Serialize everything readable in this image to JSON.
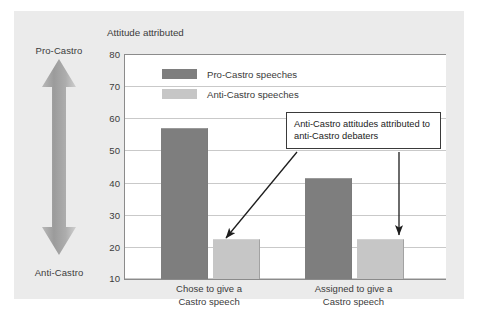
{
  "figure": {
    "title": "Attitude attributed",
    "pole_top_label": "Pro-Castro",
    "pole_bottom_label": "Anti-Castro",
    "annotation": "Anti-Castro attitudes attributed to anti-Castro debaters",
    "colors": {
      "pro_castro_bar": "#7e7e7e",
      "anti_castro_bar": "#c6c6c6",
      "background": "#ebebeb",
      "plot_background": "#ffffff",
      "gridline": "#c9c9c9",
      "axis": "#8b8b8b",
      "text": "#3b3b3b",
      "callout_border": "#3a3a3a"
    }
  },
  "chart_data": {
    "type": "bar",
    "title": "Attitude attributed",
    "xlabel": "",
    "ylabel": "Attitude attributed",
    "ylim": [
      10,
      80
    ],
    "yticks": [
      10,
      20,
      30,
      40,
      50,
      60,
      70,
      80
    ],
    "grid": true,
    "legend_position": "top-left-inside",
    "categories": [
      "Chose to give a Castro speech",
      "Assigned to give a Castro speech"
    ],
    "series": [
      {
        "name": "Pro-Castro speeches",
        "color": "#7e7e7e",
        "values": [
          57,
          41.5
        ]
      },
      {
        "name": "Anti-Castro speeches",
        "color": "#c6c6c6",
        "values": [
          22.5,
          22.5
        ]
      }
    ],
    "annotations": [
      {
        "text": "Anti-Castro attitudes attributed to anti-Castro debaters",
        "points_to": [
          "Chose to give a Castro speech / Anti-Castro speeches",
          "Assigned to give a Castro speech / Anti-Castro speeches"
        ]
      }
    ],
    "axis_pole_labels": {
      "high": "Pro-Castro",
      "low": "Anti-Castro"
    }
  }
}
